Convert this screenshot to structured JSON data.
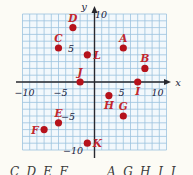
{
  "colors": {
    "page_bg": "#fcfbf5",
    "grid_bg": "#f2f8fc",
    "grid_line": "#9cc3de",
    "axis": "#28282e",
    "tick_text": "#1c2340",
    "point_fill": "#b5121b",
    "point_label": "#c1272d",
    "caption_text": "#3a3a3a"
  },
  "chart_data": {
    "type": "scatter",
    "title": "",
    "xlabel": "x",
    "ylabel": "y",
    "xlim": [
      -10,
      10
    ],
    "ylim": [
      -10,
      10
    ],
    "grid": true,
    "grid_step": 1,
    "x_ticks": [
      {
        "value": -10,
        "label": "−10"
      },
      {
        "value": -5,
        "label": "−5"
      },
      {
        "value": 5,
        "label": "5"
      },
      {
        "value": 10,
        "label": "10"
      }
    ],
    "y_ticks": [
      {
        "value": 10,
        "label": "10"
      },
      {
        "value": 5,
        "label": "5"
      },
      {
        "value": -5,
        "label": "−5"
      },
      {
        "value": -10,
        "label": "−10"
      }
    ],
    "points": [
      {
        "label": "A",
        "x": 4,
        "y": 5,
        "label_side": "above"
      },
      {
        "label": "B",
        "x": 7,
        "y": 2,
        "label_side": "above"
      },
      {
        "label": "C",
        "x": -5,
        "y": 5,
        "label_side": "above"
      },
      {
        "label": "D",
        "x": -3,
        "y": 8,
        "label_side": "above"
      },
      {
        "label": "E",
        "x": -5,
        "y": -6,
        "label_side": "above"
      },
      {
        "label": "F",
        "x": -7,
        "y": -7,
        "label_side": "left"
      },
      {
        "label": "G",
        "x": 4,
        "y": -5,
        "label_side": "above"
      },
      {
        "label": "H",
        "x": 2,
        "y": -2,
        "label_side": "below"
      },
      {
        "label": "I",
        "x": 6,
        "y": 0,
        "label_side": "below"
      },
      {
        "label": "J",
        "x": -2,
        "y": 0,
        "label_side": "above"
      },
      {
        "label": "K",
        "x": -1,
        "y": -9,
        "label_side": "right"
      },
      {
        "label": "L",
        "x": -1,
        "y": 4,
        "label_side": "right"
      }
    ]
  },
  "caption": {
    "left_fragment": "C, D, E, F",
    "right_fragment": "A, G, H, I, J"
  }
}
